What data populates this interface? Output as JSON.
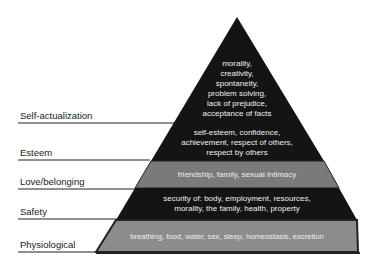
{
  "diagram": {
    "type": "pyramid",
    "levels": [
      {
        "name": "Self-actualization",
        "lines": [
          "morality,",
          "creativity,",
          "spontaneity,",
          "problem solving,",
          "lack of prejudice,",
          "acceptance of facts"
        ],
        "color": "#111111"
      },
      {
        "name": "Esteem",
        "lines": [
          "self-esteem, confidence,",
          "achievement, respect of others,",
          "respect by others"
        ],
        "color": "#1a1a1a"
      },
      {
        "name": "Love/belonging",
        "lines": [
          "friendship, family, sexual intimacy"
        ],
        "color": "#777777"
      },
      {
        "name": "Safety",
        "lines": [
          "security of: body, employment, resources,",
          "morality, the family, health, property"
        ],
        "color": "#1a1a1a"
      },
      {
        "name": "Physiological",
        "lines": [
          "breathing, food, water, sex, sleep, homeostasis, excretion"
        ],
        "color": "#8a8a8a"
      }
    ]
  }
}
